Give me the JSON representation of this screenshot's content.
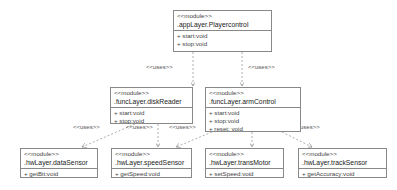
{
  "diagram": {
    "type": "uml-module-dependency",
    "relation_label": "<<uses>>",
    "colors": {
      "border": "#888888",
      "line": "#999999",
      "text": "#333333",
      "background": "#ffffff"
    },
    "modules": [
      {
        "id": "app",
        "stereotype": "<<module>>",
        "name": ".appLayer.Playercontrol",
        "operations": [
          "+ start:void",
          "+ stop:void"
        ]
      },
      {
        "id": "disk",
        "stereotype": "<<module>>",
        "name": ".funcLayer.diskReader",
        "operations": [
          "+ start:void",
          "+ stop:void"
        ]
      },
      {
        "id": "arm",
        "stereotype": "<<module>>",
        "name": ".funcLayer.armControl",
        "operations": [
          "+ start:void",
          "+ stop:void",
          "+ reset: void"
        ]
      },
      {
        "id": "data",
        "stereotype": "<<module>>",
        "name": ".hwLayer.dataSensor",
        "operations": [
          "+ getBit:void"
        ]
      },
      {
        "id": "speed",
        "stereotype": "<<module>>",
        "name": ".hwLayer.speedSensor",
        "operations": [
          "+ getSpeed:void"
        ]
      },
      {
        "id": "trans",
        "stereotype": "<<module>>",
        "name": ".hwLayer.transMotor",
        "operations": [
          "+ setSpeed:void"
        ]
      },
      {
        "id": "track",
        "stereotype": "<<module>>",
        "name": ".hwLayer.trackSensor",
        "operations": [
          "+ getAccuracy:void"
        ]
      }
    ],
    "edges": [
      {
        "from": "app",
        "to": "disk",
        "label": "<<uses>>"
      },
      {
        "from": "app",
        "to": "arm",
        "label": "<<uses>>"
      },
      {
        "from": "disk",
        "to": "data",
        "label": "<<uses>>"
      },
      {
        "from": "disk",
        "to": "speed",
        "label": "<<uses>>"
      },
      {
        "from": "arm",
        "to": "speed",
        "label": "<<uses>>"
      },
      {
        "from": "arm",
        "to": "trans",
        "label": "<<uses>>"
      },
      {
        "from": "arm",
        "to": "track",
        "label": "<<uses>>"
      }
    ]
  }
}
